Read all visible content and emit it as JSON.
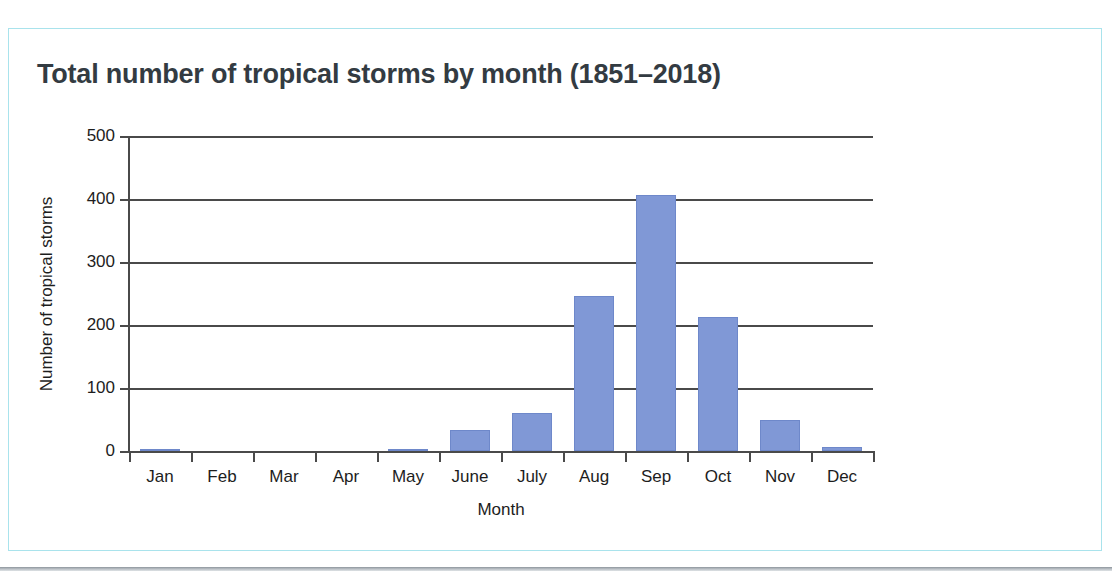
{
  "card": {
    "border_color": "#a9e3ec",
    "background": "#ffffff"
  },
  "chart_data": {
    "type": "bar",
    "title": "Total number of tropical storms by month (1851–2018)",
    "xlabel": "Month",
    "ylabel": "Number of tropical storms",
    "categories": [
      "Jan",
      "Feb",
      "Mar",
      "Apr",
      "May",
      "June",
      "July",
      "Aug",
      "Sep",
      "Oct",
      "Nov",
      "Dec"
    ],
    "values": [
      3,
      0,
      0,
      0,
      3,
      33,
      60,
      246,
      407,
      212,
      49,
      6
    ],
    "ylim": [
      0,
      500
    ],
    "yticks": [
      0,
      100,
      200,
      300,
      400,
      500
    ],
    "ytick_labels": [
      "0",
      "100",
      "200",
      "300",
      "400",
      "500"
    ],
    "grid": true,
    "grid_axis": "y",
    "legend": false,
    "bar_color": "#8098d6",
    "bar_edge_color": "#6e88ca",
    "axis_color": "#4a4a4a",
    "title_color": "#333b42",
    "tick_label_color": "#1d1d1d"
  }
}
